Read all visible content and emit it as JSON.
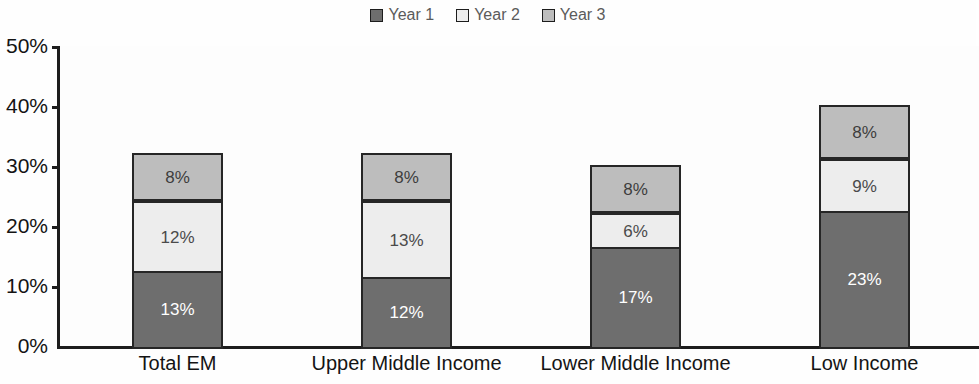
{
  "chart_data": {
    "type": "bar",
    "subtype": "stacked-bar",
    "title": "",
    "xlabel": "",
    "ylabel": "",
    "categories": [
      "Total EM",
      "Upper Middle Income",
      "Lower Middle Income",
      "Low Income"
    ],
    "series": [
      {
        "name": "Year 1",
        "values": [
          13,
          12,
          17,
          23
        ],
        "color": "#6e6e6e"
      },
      {
        "name": "Year 2",
        "values": [
          12,
          13,
          6,
          9
        ],
        "color": "#ededed"
      },
      {
        "name": "Year 3",
        "values": [
          8,
          8,
          8,
          9
        ],
        "color": "#bdbdbd"
      }
    ],
    "data_labels": [
      [
        "13%",
        "12%",
        "17%",
        "23%"
      ],
      [
        "12%",
        "13%",
        "6%",
        "9%"
      ],
      [
        "8%",
        "8%",
        "8%",
        "9%"
      ]
    ],
    "totals": [
      33,
      33,
      31,
      41
    ],
    "ylim": [
      0,
      50
    ],
    "ytick_step": 10,
    "ytick_labels": [
      "50%",
      "40%",
      "30%",
      "20%",
      "10%",
      "0%"
    ],
    "ytick_values": [
      50,
      40,
      30,
      20,
      10,
      0
    ],
    "grid": false,
    "legend_position": "top-center",
    "value_unit": "%"
  },
  "legend": {
    "entries": [
      {
        "label": "Year 1"
      },
      {
        "label": "Year 2"
      },
      {
        "label": "Year 3"
      }
    ]
  },
  "axis": {
    "y_labels": [
      "50%",
      "40%",
      "30%",
      "20%",
      "10%",
      "0%"
    ],
    "x_labels": [
      "Total EM",
      "Upper Middle Income",
      "Lower Middle Income",
      "Low Income"
    ]
  },
  "bars": [
    {
      "category": "Total EM",
      "segments": [
        {
          "series": "Year 1",
          "label": "13%",
          "value": 13
        },
        {
          "series": "Year 2",
          "label": "12%",
          "value": 12
        },
        {
          "series": "Year 3",
          "label": "8%",
          "value": 8
        }
      ]
    },
    {
      "category": "Upper Middle Income",
      "segments": [
        {
          "series": "Year 1",
          "label": "12%",
          "value": 12
        },
        {
          "series": "Year 2",
          "label": "13%",
          "value": 13
        },
        {
          "series": "Year 3",
          "label": "8%",
          "value": 8
        }
      ]
    },
    {
      "category": "Lower Middle Income",
      "segments": [
        {
          "series": "Year 1",
          "label": "17%",
          "value": 17
        },
        {
          "series": "Year 2",
          "label": "6%",
          "value": 6
        },
        {
          "series": "Year 3",
          "label": "8%",
          "value": 8
        }
      ]
    },
    {
      "category": "Low Income",
      "segments": [
        {
          "series": "Year 1",
          "label": "23%",
          "value": 23
        },
        {
          "series": "Year 2",
          "label": "9%",
          "value": 9
        },
        {
          "series": "Year 3",
          "label": "8%",
          "value": 9
        }
      ]
    }
  ]
}
